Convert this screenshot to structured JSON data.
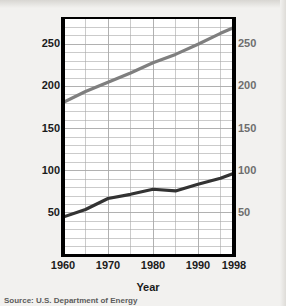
{
  "chart_data": {
    "type": "line",
    "title": "",
    "xlabel": "Year",
    "ylabel": "Energy consumption (in quadrillions of British thermal units)",
    "y2label": "Population (in millions)",
    "grid": true,
    "legend": "none",
    "xlim": [
      1960,
      1998
    ],
    "ylim": [
      0,
      280
    ],
    "y2lim": [
      0,
      280
    ],
    "xticks": [
      "1960",
      "1970",
      "1980",
      "1990",
      "1998"
    ],
    "xtick_values": [
      1960,
      1970,
      1980,
      1990,
      1998
    ],
    "yticks": [
      "50",
      "100",
      "150",
      "200",
      "250"
    ],
    "ytick_values": [
      50,
      100,
      150,
      200,
      250
    ],
    "y2ticks": [
      "50",
      "100",
      "150",
      "200",
      "250"
    ],
    "y2tick_values": [
      50,
      100,
      150,
      200,
      250
    ],
    "series": [
      {
        "name": "Population (in millions)",
        "axis": "right",
        "color": "#7f7f7f",
        "x": [
          1960,
          1965,
          1970,
          1975,
          1980,
          1985,
          1990,
          1995,
          1998
        ],
        "values": [
          181,
          194,
          205,
          216,
          228,
          238,
          250,
          263,
          270
        ]
      },
      {
        "name": "Energy consumption (in quadrillions of British thermal units)",
        "axis": "left",
        "color": "#333333",
        "x": [
          1960,
          1965,
          1970,
          1975,
          1980,
          1985,
          1990,
          1995,
          1998
        ],
        "values": [
          45,
          54,
          67,
          72,
          78,
          76,
          84,
          91,
          97
        ]
      }
    ]
  },
  "axes": {
    "left_title_line1": "Energy consumption",
    "left_title_line2": "(in quadrillions of British thermal units)",
    "right_title": "Population (in millions)",
    "x_title": "Year"
  },
  "source": {
    "note": "Source: U.S. Department of Energy"
  },
  "colors": {
    "population_line": "#7f7f7f",
    "energy_line": "#333333",
    "axis": "#000000",
    "grid": "#a9a9a9",
    "background": "#f2f1ef",
    "left_text": "#1b1b1b",
    "right_text": "#6e6e6e"
  }
}
